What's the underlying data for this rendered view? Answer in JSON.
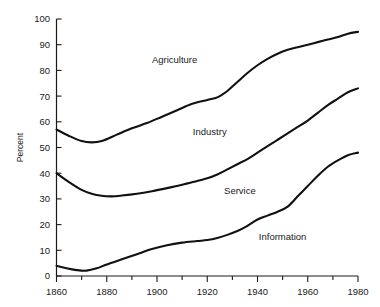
{
  "chart_data": {
    "type": "line",
    "title": "",
    "subtitle": "",
    "xlabel": "",
    "ylabel": "Percent",
    "xlim": [
      1860,
      1980
    ],
    "ylim": [
      0,
      100
    ],
    "grid": false,
    "legend_position": "inline-labels",
    "x_ticks_major": [
      1860,
      1880,
      1900,
      1920,
      1940,
      1960,
      1980
    ],
    "x_ticks_minor": [
      1870,
      1890,
      1910,
      1930,
      1950,
      1970
    ],
    "x_tick_labels": [
      "1860",
      "1880",
      "1900",
      "1920",
      "1940",
      "1960",
      "1980"
    ],
    "y_ticks": [
      0,
      10,
      20,
      30,
      40,
      50,
      60,
      70,
      80,
      90,
      100
    ],
    "y_tick_labels": [
      "0",
      "10",
      "20",
      "30",
      "40",
      "50",
      "60",
      "70",
      "80",
      "90",
      "100"
    ],
    "annotations": [
      {
        "text": "Agriculture",
        "x": 1907,
        "y": 83
      },
      {
        "text": "Industry",
        "x": 1921,
        "y": 55
      },
      {
        "text": "Service",
        "x": 1933,
        "y": 32
      },
      {
        "text": "Information",
        "x": 1950,
        "y": 14
      }
    ],
    "series": [
      {
        "name": "Agriculture",
        "comment": "upper cumulative boundary curve",
        "x": [
          1860,
          1865,
          1870,
          1874,
          1878,
          1884,
          1890,
          1896,
          1902,
          1908,
          1914,
          1920,
          1924,
          1928,
          1932,
          1936,
          1940,
          1944,
          1948,
          1952,
          1956,
          1960,
          1964,
          1968,
          1972,
          1976,
          1980
        ],
        "values": [
          57,
          54.5,
          52.5,
          52,
          52.5,
          55,
          57.5,
          59.5,
          62,
          64.5,
          67,
          68.5,
          69.5,
          72,
          75.5,
          79,
          82,
          84.5,
          86.5,
          88,
          89,
          90,
          91,
          92,
          93,
          94.3,
          95
        ]
      },
      {
        "name": "Industry",
        "comment": "middle cumulative boundary curve",
        "x": [
          1860,
          1865,
          1870,
          1874,
          1878,
          1882,
          1886,
          1892,
          1898,
          1904,
          1910,
          1916,
          1920,
          1924,
          1928,
          1932,
          1936,
          1940,
          1944,
          1948,
          1952,
          1956,
          1960,
          1964,
          1968,
          1972,
          1976,
          1980
        ],
        "values": [
          40,
          36.5,
          33.5,
          32,
          31.2,
          31,
          31.3,
          32,
          33,
          34.2,
          35.5,
          37,
          38,
          39.5,
          41.5,
          43.5,
          45.5,
          48,
          50.5,
          53,
          55.5,
          58,
          60.5,
          63.5,
          66.5,
          69,
          71.5,
          73
        ]
      },
      {
        "name": "Service",
        "comment": "lower cumulative boundary curve",
        "x": [
          1860,
          1864,
          1868,
          1872,
          1876,
          1880,
          1886,
          1892,
          1898,
          1904,
          1910,
          1916,
          1920,
          1924,
          1928,
          1932,
          1936,
          1940,
          1944,
          1948,
          1952,
          1956,
          1960,
          1964,
          1968,
          1972,
          1976,
          1980
        ],
        "values": [
          4,
          3,
          2.3,
          2.1,
          3,
          4.5,
          6.5,
          8.5,
          10.5,
          12,
          13,
          13.6,
          14,
          14.8,
          16,
          17.5,
          19.5,
          22,
          23.5,
          25,
          27,
          31,
          35,
          39,
          42.5,
          45,
          47,
          48
        ]
      }
    ]
  },
  "figure": {
    "y_axis_title": "Percent",
    "series_labels": {
      "agriculture": "Agriculture",
      "industry": "Industry",
      "service": "Service",
      "information": "Information"
    }
  }
}
